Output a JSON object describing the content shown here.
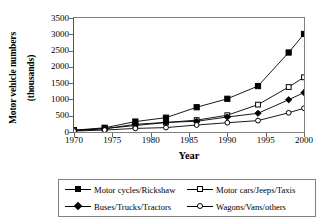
{
  "chart_data": {
    "type": "line",
    "title": "",
    "xlabel": "Year",
    "ylabel": "Motor vehicle numbers (thousands)",
    "ylabel_line1": "Motor vehicle numbers",
    "ylabel_line2": "(thousands)",
    "xlim": [
      1970,
      2000
    ],
    "ylim": [
      0,
      3500
    ],
    "xticks": [
      1970,
      1975,
      1980,
      1985,
      1990,
      1995,
      2000
    ],
    "yticks": [
      0,
      500,
      1000,
      1500,
      2000,
      2500,
      3000,
      3500
    ],
    "grid": false,
    "legend_position": "bottom",
    "x": [
      1970,
      1974,
      1978,
      1982,
      1986,
      1990,
      1994,
      1998,
      2000
    ],
    "series": [
      {
        "name": "Motor cycles/Rickshaw",
        "marker": "filled-square",
        "values": [
          55,
          130,
          320,
          440,
          760,
          1020,
          1410,
          2440,
          3010
        ]
      },
      {
        "name": "Motor cars/Jeeps/Taxis",
        "marker": "open-square",
        "values": [
          50,
          105,
          200,
          290,
          365,
          515,
          840,
          1380,
          1680
        ]
      },
      {
        "name": "Buses/Trucks/Tractors",
        "marker": "filled-diamond",
        "values": [
          45,
          100,
          235,
          295,
          330,
          460,
          575,
          990,
          1210
        ]
      },
      {
        "name": "Wagons/Vans/others",
        "marker": "open-circle",
        "values": [
          30,
          60,
          110,
          135,
          215,
          285,
          350,
          590,
          730
        ]
      }
    ]
  },
  "colors": {
    "series_line": "#000000",
    "axis": "#808080",
    "text": "#000000",
    "background": "#ffffff"
  }
}
